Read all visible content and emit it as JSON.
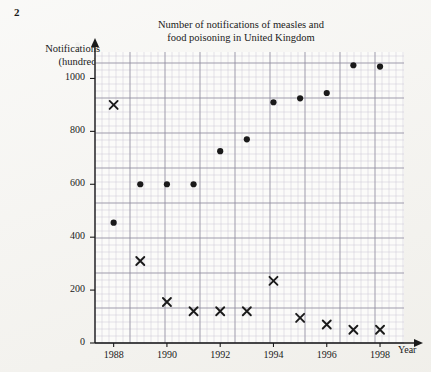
{
  "question_number": "2",
  "labels": {
    "title_line1": "Number of notifications of measles and",
    "title_line2": "food poisoning in United Kingdom",
    "y_axis_line1": "Notifications",
    "y_axis_line2": "(hundred)",
    "x_axis": "Year"
  },
  "colors": {
    "ink": "#1a1a1a",
    "grid_minor": "#c9c6d6",
    "grid_major": "#8d8a9c",
    "paper": "#f3f2ee"
  },
  "chart_data": {
    "type": "scatter",
    "title": "Number of notifications of measles and food poisoning in United Kingdom",
    "xlabel": "Year",
    "ylabel": "Notifications (hundred)",
    "xlim": [
      1987.3,
      1998.9
    ],
    "ylim": [
      0,
      1100
    ],
    "grid": true,
    "legend": null,
    "y_ticks": [
      0,
      200,
      400,
      600,
      800,
      1000
    ],
    "x_ticks": [
      1988,
      1990,
      1992,
      1994,
      1996,
      1998
    ],
    "x": [
      1988,
      1989,
      1990,
      1991,
      1992,
      1993,
      1994,
      1995,
      1996,
      1997,
      1998
    ],
    "series": [
      {
        "name": "dot-series",
        "marker": "circle",
        "values": [
          455,
          600,
          600,
          600,
          725,
          770,
          910,
          925,
          945,
          1050,
          1045
        ]
      },
      {
        "name": "cross-series",
        "marker": "cross",
        "values": [
          900,
          310,
          155,
          120,
          120,
          120,
          235,
          95,
          70,
          50,
          50
        ]
      }
    ]
  },
  "plot_geometry": {
    "left": 95,
    "right": 404,
    "top": 52,
    "bottom": 343,
    "minor_step": 7.0
  }
}
